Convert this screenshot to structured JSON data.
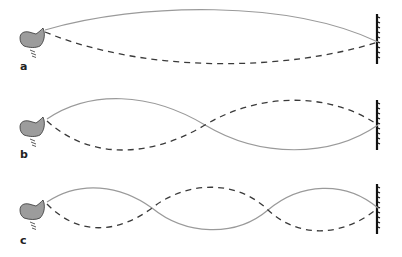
{
  "figure": {
    "colors": {
      "solid_curve": "#9a9a9a",
      "dashed_curve": "#3a3a3a",
      "hand_fill": "#9c9c9c",
      "hand_outline": "#333333",
      "wall": "#111111"
    },
    "panels": [
      {
        "label": "a",
        "mode": "fundamental (half wavelength)",
        "loops": 1
      },
      {
        "label": "b",
        "mode": "second harmonic (one wavelength)",
        "loops": 2
      },
      {
        "label": "c",
        "mode": "third harmonic (one and a half wavelengths)",
        "loops": 3
      }
    ]
  }
}
